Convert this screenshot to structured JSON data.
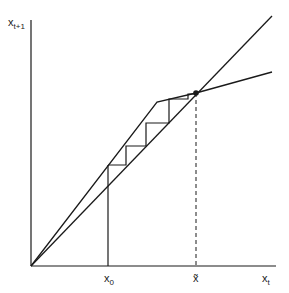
{
  "diagram": {
    "type": "cobweb-diagram",
    "y_axis_label": {
      "base": "x",
      "sub": "t+1"
    },
    "x_axis_label": {
      "base": "x",
      "sub": "t"
    },
    "tick_labels": {
      "x0": {
        "base": "x",
        "sub": "0"
      },
      "xtilde": {
        "base": "x̃",
        "sub": ""
      }
    },
    "line_color": "#1a1a1a",
    "elements": [
      "45-degree line",
      "piecewise-linear map with kink",
      "cobweb staircase from x0",
      "fixed point marker at x-tilde",
      "dashed vertical drop line"
    ]
  }
}
